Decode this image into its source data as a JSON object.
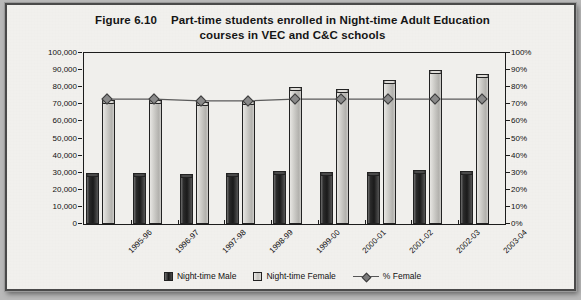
{
  "figure": {
    "label": "Figure 6.10",
    "title_line1": "Part-time students enrolled in Night-time Adult Education",
    "title_line2": "courses in VEC and C&C schools"
  },
  "legend": {
    "male": "Night-time Male",
    "female": "Night-time Female",
    "percent": "% Female"
  },
  "chart_data": {
    "type": "bar",
    "xlabel": "",
    "ylabel": "",
    "y2label": "",
    "grid": false,
    "legend_position": "bottom",
    "categories": [
      "1995-96",
      "1996-97",
      "1997-98",
      "1998-99",
      "1999-00",
      "2000-01",
      "2001-02",
      "2002-03",
      "2003-04"
    ],
    "ylim": [
      0,
      100000
    ],
    "yticks": [
      0,
      10000,
      20000,
      30000,
      40000,
      50000,
      60000,
      70000,
      80000,
      90000,
      100000
    ],
    "ytick_labels": [
      "0",
      "10,000",
      "20,000",
      "30,000",
      "40,000",
      "50,000",
      "60,000",
      "70,000",
      "80,000",
      "90,000",
      "100,000"
    ],
    "y2lim": [
      0,
      100
    ],
    "y2ticks": [
      0,
      10,
      20,
      30,
      40,
      50,
      60,
      70,
      80,
      90,
      100
    ],
    "y2tick_labels": [
      "0%",
      "10%",
      "20%",
      "30%",
      "40%",
      "50%",
      "60%",
      "70%",
      "80%",
      "90%",
      "100%"
    ],
    "series": [
      {
        "name": "Night-time Male",
        "kind": "bar",
        "axis": "left",
        "values": [
          30000,
          30000,
          29500,
          30000,
          31000,
          30500,
          30500,
          31500,
          31000
        ]
      },
      {
        "name": "Night-time Female",
        "kind": "bar",
        "axis": "left",
        "values": [
          72500,
          72500,
          71500,
          72000,
          80000,
          79000,
          84000,
          90000,
          88000
        ]
      },
      {
        "name": "% Female",
        "kind": "line",
        "axis": "right",
        "values": [
          73,
          73,
          72,
          72,
          73,
          73,
          73,
          73,
          73
        ]
      }
    ]
  }
}
